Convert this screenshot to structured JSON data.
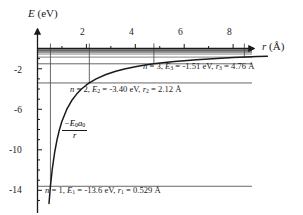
{
  "figure": {
    "name": "coulomb-potential-energy-hydrogen",
    "background_color": "#ffffff",
    "curve_color": "#1a1a1a",
    "level_color": "#4d4d4d",
    "axis_color": "#1a1a1a"
  },
  "axes": {
    "y_title": "E",
    "y_unit": "(eV)",
    "x_title": "r",
    "x_unit": "(Å)",
    "x_ticks": [
      "2",
      "4",
      "6",
      "8"
    ],
    "y_ticks": [
      "-2",
      "-6",
      "-10",
      "-14"
    ]
  },
  "annotations": {
    "n3": {
      "n_sym": "n",
      "n_val": "3",
      "e_sym": "E",
      "e_sub": "3",
      "e_val": "-1.51 eV",
      "r_sym": "r",
      "r_sub": "3",
      "r_val": "4.76 Å",
      "text": "n = 3, E3 = −1.51 eV, r3 = 4.76 Å"
    },
    "n2": {
      "n_sym": "n",
      "n_val": "2",
      "e_sym": "E",
      "e_sub": "2",
      "e_val": "-3.40 eV",
      "r_sym": "r",
      "r_sub": "2",
      "r_val": "2.12 Å",
      "text": "n = 2, E2 = −3.40 eV, r2 = 2.12 Å"
    },
    "n1": {
      "n_sym": "n",
      "n_val": "1",
      "e_sym": "E",
      "e_sub": "1",
      "e_val": "-13.6 eV",
      "r_sym": "r",
      "r_sub": "1",
      "r_val": "0.529 Å",
      "text": "n = 1, E1 = −13.6 eV, r1 = 0.529 Å"
    },
    "formula": {
      "numerator": "-E0a0",
      "denominator": "r"
    }
  },
  "chart_data": {
    "type": "line",
    "title": "",
    "xlabel": "r (Å)",
    "ylabel": "E (eV)",
    "xlim": [
      0,
      9.6
    ],
    "ylim": [
      -15.2,
      0.6
    ],
    "grid": false,
    "legend": "none",
    "curve": {
      "name": "-E0*a0/r",
      "label": "−E₀a₀ / r",
      "formula_constant_eV_angstrom": 7.1924,
      "x": [
        0.47,
        0.529,
        0.6,
        0.7,
        0.8,
        0.9,
        1.0,
        1.2,
        1.4,
        1.6,
        1.8,
        2.0,
        2.12,
        2.4,
        2.8,
        3.2,
        3.6,
        4.0,
        4.4,
        4.76,
        5.2,
        5.6,
        6.0,
        6.5,
        7.0,
        7.5,
        8.0,
        8.5,
        9.0,
        9.4
      ],
      "y": [
        -15.3,
        -13.6,
        -11.99,
        -10.27,
        -8.99,
        -7.99,
        -7.19,
        -5.99,
        -5.14,
        -4.5,
        -4.0,
        -3.6,
        -3.4,
        -3.0,
        -2.57,
        -2.25,
        -2.0,
        -1.8,
        -1.63,
        -1.51,
        -1.38,
        -1.28,
        -1.2,
        -1.11,
        -1.03,
        -0.96,
        -0.9,
        -0.85,
        -0.8,
        -0.77
      ]
    },
    "energy_levels": [
      {
        "n": 1,
        "energy_eV": -13.6,
        "radius_A": 0.529,
        "drop_line": true,
        "labeled": true
      },
      {
        "n": 2,
        "energy_eV": -3.4,
        "radius_A": 2.12,
        "drop_line": true,
        "labeled": true
      },
      {
        "n": 3,
        "energy_eV": -1.51,
        "radius_A": 4.76,
        "drop_line": true,
        "labeled": true
      },
      {
        "n": 4,
        "energy_eV": -0.85,
        "radius_A": 8.46,
        "drop_line": true,
        "labeled": false
      },
      {
        "n": 5,
        "energy_eV": -0.544,
        "radius_A": 13.2,
        "drop_line": false,
        "labeled": false
      },
      {
        "n": 6,
        "energy_eV": -0.378,
        "radius_A": 19.0,
        "drop_line": false,
        "labeled": false
      },
      {
        "n": 7,
        "energy_eV": -0.278,
        "radius_A": 25.9,
        "drop_line": false,
        "labeled": false
      },
      {
        "n": 8,
        "energy_eV": -0.213,
        "radius_A": 33.9,
        "drop_line": false,
        "labeled": false
      },
      {
        "n": 9,
        "energy_eV": -0.168,
        "radius_A": 42.8,
        "drop_line": false,
        "labeled": false
      },
      {
        "n": 10,
        "energy_eV": -0.136,
        "radius_A": 52.9,
        "drop_line": false,
        "labeled": false
      }
    ]
  }
}
